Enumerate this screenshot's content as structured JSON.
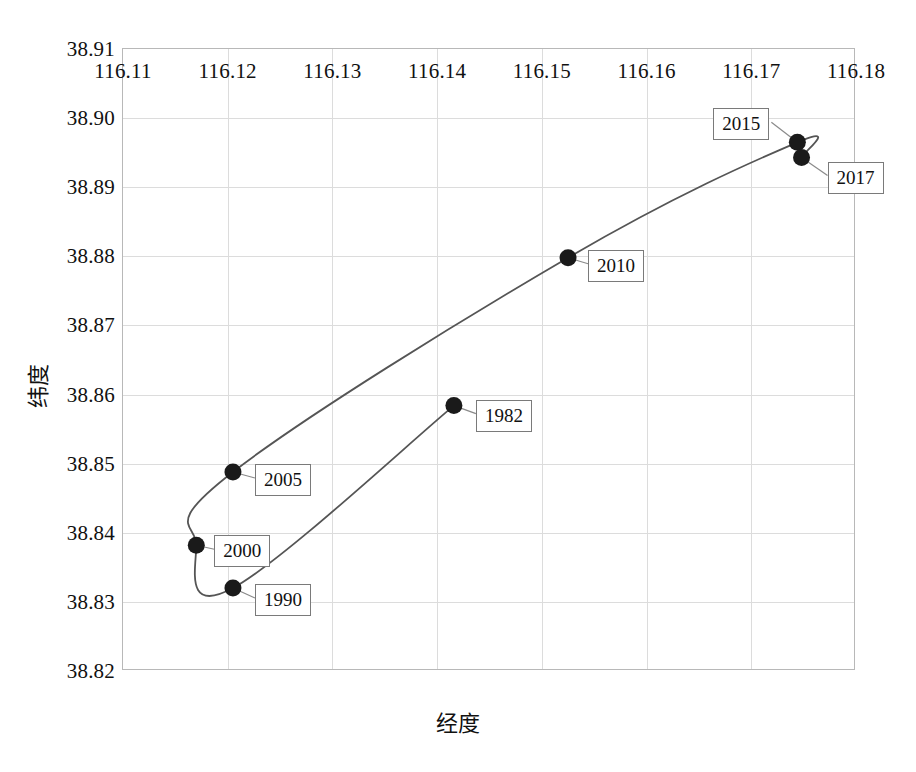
{
  "chart_data": {
    "type": "line",
    "title": "",
    "xlabel": "经度",
    "ylabel": "纬度",
    "xlim": [
      116.11,
      116.18
    ],
    "ylim": [
      38.82,
      38.91
    ],
    "xticks": [
      "116.11",
      "116.12",
      "116.13",
      "116.14",
      "116.15",
      "116.16",
      "116.17",
      "116.18"
    ],
    "xtick_values": [
      116.11,
      116.12,
      116.13,
      116.14,
      116.15,
      116.16,
      116.17,
      116.18
    ],
    "yticks": [
      "38.82",
      "38.83",
      "38.84",
      "38.85",
      "38.86",
      "38.87",
      "38.88",
      "38.89",
      "38.90",
      "38.91"
    ],
    "ytick_values": [
      38.82,
      38.83,
      38.84,
      38.85,
      38.86,
      38.87,
      38.88,
      38.89,
      38.9,
      38.91
    ],
    "grid": true,
    "legend": "none",
    "series": [
      {
        "name": "质心迁移轨迹",
        "marker": "filled-circle",
        "line_color": "#555555",
        "marker_color": "#1a1a1a",
        "points": [
          {
            "label": "1982",
            "x": 116.1416,
            "y": 38.8584
          },
          {
            "label": "1990",
            "x": 116.1205,
            "y": 38.832
          },
          {
            "label": "2000",
            "x": 116.117,
            "y": 38.8382
          },
          {
            "label": "2005",
            "x": 116.1205,
            "y": 38.8488
          },
          {
            "label": "2010",
            "x": 116.1525,
            "y": 38.8798
          },
          {
            "label": "2015",
            "x": 116.1744,
            "y": 38.8965
          },
          {
            "label": "2017",
            "x": 116.1748,
            "y": 38.8943
          }
        ]
      }
    ],
    "annotations": [
      {
        "text": "1982",
        "point": "1982"
      },
      {
        "text": "1990",
        "point": "1990"
      },
      {
        "text": "2000",
        "point": "2000"
      },
      {
        "text": "2005",
        "point": "2005"
      },
      {
        "text": "2010",
        "point": "2010"
      },
      {
        "text": "2015",
        "point": "2015"
      },
      {
        "text": "2017",
        "point": "2017"
      }
    ]
  },
  "axes": {
    "x_title": "经度",
    "y_title": "纬度"
  },
  "caption": ""
}
